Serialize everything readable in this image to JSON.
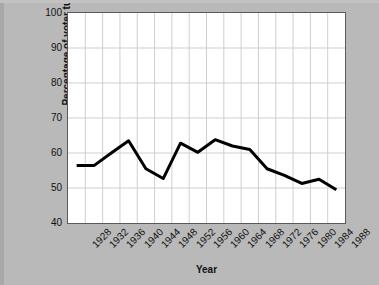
{
  "chart_data": {
    "type": "line",
    "title": "",
    "xlabel": "Year",
    "ylabel": "Percentage of voter turnout",
    "categories": [
      "1928",
      "1932",
      "1936",
      "1940",
      "1944",
      "1948",
      "1952",
      "1956",
      "1960",
      "1964",
      "1968",
      "1972",
      "1976",
      "1980",
      "1984",
      "1988"
    ],
    "values": [
      56.4,
      56.4,
      60.0,
      63.5,
      55.5,
      52.7,
      62.8,
      60.2,
      63.8,
      62.0,
      61.0,
      55.5,
      53.6,
      51.3,
      52.5,
      49.5
    ],
    "series": [
      {
        "name": "Percentage of voter turnout",
        "values": [
          56.4,
          56.4,
          60.0,
          63.5,
          55.5,
          52.7,
          62.8,
          60.2,
          63.8,
          62.0,
          61.0,
          55.5,
          53.6,
          51.3,
          52.5,
          49.5
        ]
      }
    ],
    "ylim": [
      40,
      100
    ],
    "yticks": [
      40,
      50,
      60,
      70,
      80,
      90,
      100
    ],
    "ytick_labels": [
      "40",
      "50",
      "60",
      "70",
      "80",
      "90",
      "100"
    ],
    "grid": true,
    "legend": false,
    "legend_position": "none",
    "line_color": "#000000",
    "plot_background": "#ffffff",
    "figure_background": "#b9b9b9",
    "grid_color": "#cfcfcf"
  },
  "axes": {
    "y_title": "Percentage of voter turnout",
    "x_title": "Year"
  }
}
